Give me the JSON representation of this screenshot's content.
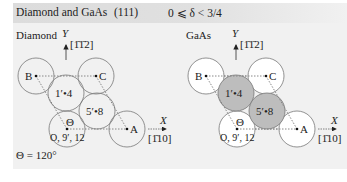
{
  "header": {
    "title": "Diamond and GaAs",
    "plane": "(111)",
    "range": "0 ⩽ δ < 3/4"
  },
  "diagrams": [
    {
      "name": "Diamond",
      "y_axis_label": "Y",
      "y_direction": "[1̄1̄2]",
      "x_axis_label": "X",
      "x_direction": "[1̄10]",
      "atoms": {
        "B": "B",
        "C": "C",
        "A": "A",
        "p1": "1′•4",
        "p5": "5′•8",
        "origin": "O, 9′, 12",
        "theta": "Θ"
      },
      "shaded_atoms": false
    },
    {
      "name": "GaAs",
      "y_axis_label": "Y",
      "y_direction": "[1̄1̄2]",
      "x_axis_label": "X",
      "x_direction": "[1̄10]",
      "atoms": {
        "B": "B",
        "C": "C",
        "A": "A",
        "p1": "1′•4",
        "p5": "5′•8",
        "origin": "O, 9′, 12",
        "theta": "Θ"
      },
      "shaded_atoms": true
    }
  ],
  "theta_value": "Θ = 120°",
  "colors": {
    "panel_bg": "#f1f1f1",
    "header_bg": "#dcdcdc",
    "circle_stroke": "#777777",
    "shaded_fill": "#bdbdbd",
    "open_fill": "#ffffff"
  }
}
